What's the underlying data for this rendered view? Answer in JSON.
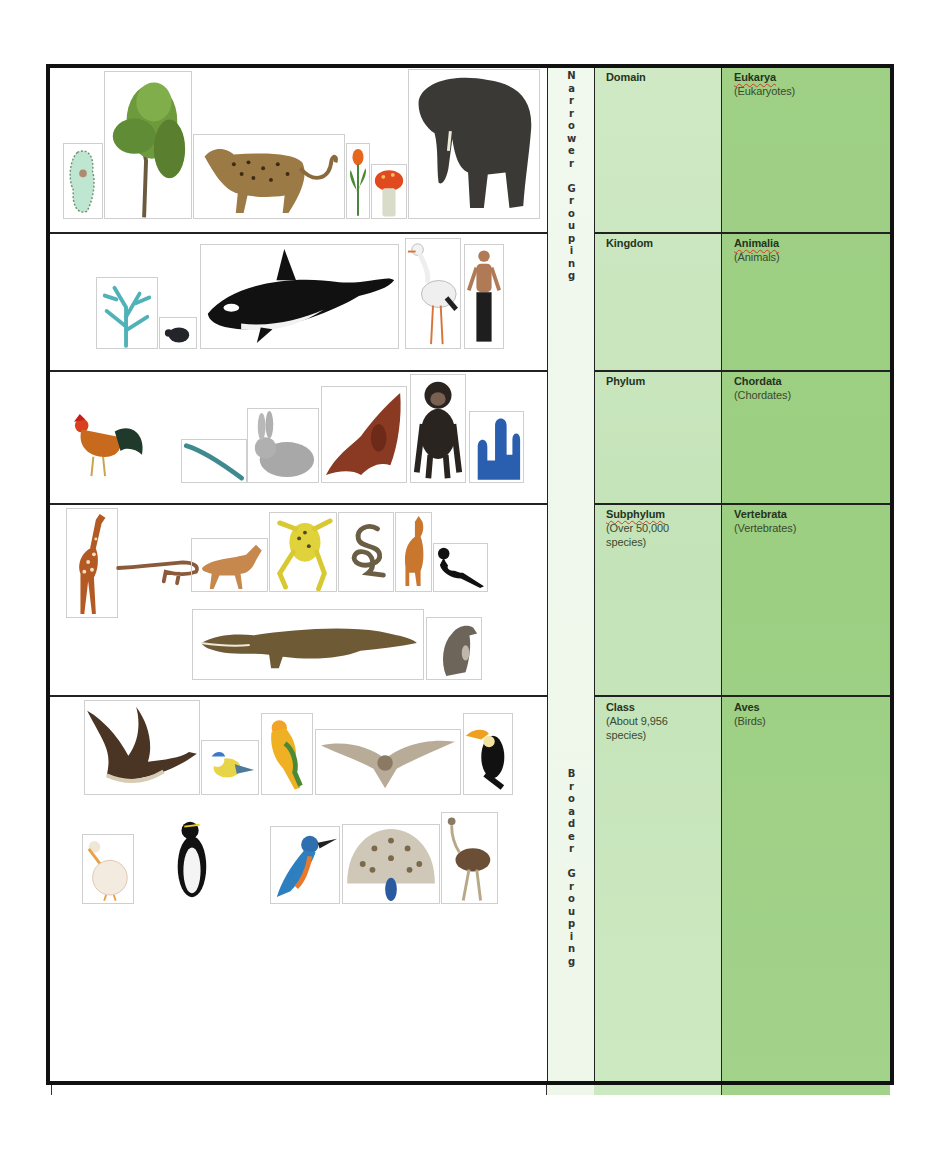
{
  "document": {
    "title": "Classification of living things (Domain to Class)",
    "side_labels": {
      "narrower": "N\na\nr\nr\no\nw\ne\nr\n\nG\nr\no\nu\np\ni\nn\ng",
      "broader": "B\nr\no\na\nd\ne\nr\n\nG\nr\no\nu\np\ni\nn\ng"
    },
    "rows": [
      {
        "rank": "Domain",
        "rank_note": "",
        "name": "Eukarya",
        "name_common": "(Eukaryotes)",
        "pictures": [
          "cactus",
          "willow-tree",
          "leopard",
          "tulip",
          "mushroom",
          "elephant"
        ]
      },
      {
        "rank": "Kingdom",
        "rank_note": "",
        "name": "Animalia",
        "name_common": "(Animals)",
        "pictures": [
          "coral",
          "beetle",
          "orca",
          "stork",
          "human"
        ]
      },
      {
        "rank": "Phylum",
        "rank_note": "",
        "name": "Chordata",
        "name_common": "(Chordates)",
        "pictures": [
          "rooster",
          "feather",
          "rabbit",
          "bat",
          "chimpanzee",
          "sea-squirt"
        ]
      },
      {
        "rank": "Subphylum",
        "rank_note_1": "(Over 50,000",
        "rank_note_2": "species)",
        "name": "Vertebrata",
        "name_common": "(Vertebrates)",
        "pictures": [
          "giraffe",
          "lizard",
          "dog",
          "frog",
          "snake",
          "cat",
          "magpie",
          "crocodile",
          "rat"
        ]
      },
      {
        "rank": "Class",
        "rank_note_1": "(About 9,956",
        "rank_note_2": "species)",
        "name": "Aves",
        "name_common": "(Birds)",
        "pictures": [
          "goose",
          "blue-tit",
          "parrot",
          "owl",
          "toucan",
          "pelican",
          "penguin",
          "kingfisher",
          "peacock",
          "ostrich"
        ]
      }
    ]
  }
}
